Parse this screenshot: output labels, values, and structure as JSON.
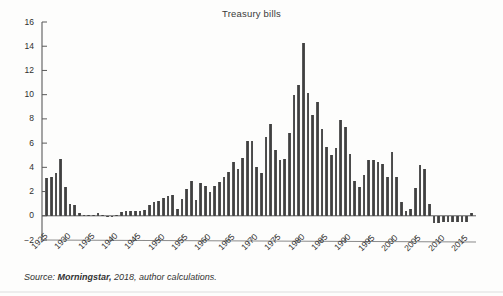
{
  "chart": {
    "title": "Treasury bills",
    "source_prefix": "Source:",
    "source_emphasis": "Morningstar,",
    "source_rest": "2018, author calculations."
  },
  "chart_data": {
    "type": "bar",
    "title": "Treasury bills",
    "xlabel": "",
    "ylabel": "",
    "ylim": [
      -2,
      16
    ],
    "ytick_values": [
      -2,
      0,
      2,
      4,
      6,
      8,
      10,
      12,
      14,
      16
    ],
    "ytick_labels": [
      "−2",
      "0",
      "2",
      "4",
      "6",
      "8",
      "10",
      "12",
      "14",
      "16"
    ],
    "xtick_labels": [
      "1925",
      "1930",
      "1935",
      "1940",
      "1945",
      "1950",
      "1955",
      "1960",
      "1965",
      "1970",
      "1975",
      "1980",
      "1985",
      "1990",
      "1995",
      "2000",
      "2005",
      "2010",
      "2015"
    ],
    "xtick_values": [
      1925,
      1930,
      1935,
      1940,
      1945,
      1950,
      1955,
      1960,
      1965,
      1970,
      1975,
      1980,
      1985,
      1990,
      1995,
      2000,
      2005,
      2010,
      2015
    ],
    "xlim": [
      1925,
      2018
    ],
    "grid": false,
    "legend": false,
    "bar_color": "#4a4a4a",
    "categories": [
      1926,
      1927,
      1928,
      1929,
      1930,
      1931,
      1932,
      1933,
      1934,
      1935,
      1936,
      1937,
      1938,
      1939,
      1940,
      1941,
      1942,
      1943,
      1944,
      1945,
      1946,
      1947,
      1948,
      1949,
      1950,
      1951,
      1952,
      1953,
      1954,
      1955,
      1956,
      1957,
      1958,
      1959,
      1960,
      1961,
      1962,
      1963,
      1964,
      1965,
      1966,
      1967,
      1968,
      1969,
      1970,
      1971,
      1972,
      1973,
      1974,
      1975,
      1976,
      1977,
      1978,
      1979,
      1980,
      1981,
      1982,
      1983,
      1984,
      1985,
      1986,
      1987,
      1988,
      1989,
      1990,
      1991,
      1992,
      1993,
      1994,
      1995,
      1996,
      1997,
      1998,
      1999,
      2000,
      2001,
      2002,
      2003,
      2004,
      2005,
      2006,
      2007,
      2008,
      2009,
      2010,
      2011,
      2012,
      2013,
      2014,
      2015,
      2016,
      2017
    ],
    "values": [
      3.1,
      3.2,
      3.5,
      4.7,
      2.4,
      1.0,
      0.9,
      0.2,
      0.1,
      0.1,
      0.1,
      0.2,
      0.1,
      0.0,
      0.0,
      0.1,
      0.3,
      0.4,
      0.4,
      0.4,
      0.4,
      0.5,
      0.9,
      1.1,
      1.2,
      1.5,
      1.6,
      1.7,
      0.6,
      1.4,
      2.2,
      2.9,
      1.3,
      2.7,
      2.5,
      2.0,
      2.5,
      2.8,
      3.2,
      3.6,
      4.4,
      3.9,
      4.8,
      6.2,
      6.2,
      4.0,
      3.5,
      6.5,
      7.6,
      5.4,
      4.6,
      4.7,
      6.8,
      10.0,
      10.8,
      14.3,
      10.1,
      8.3,
      9.4,
      7.2,
      5.7,
      5.0,
      5.6,
      7.9,
      7.3,
      5.1,
      2.9,
      2.4,
      3.4,
      4.6,
      4.6,
      4.4,
      4.3,
      3.2,
      5.3,
      3.2,
      1.1,
      0.4,
      0.6,
      2.3,
      4.2,
      3.9,
      1.0,
      -0.6,
      -0.6,
      -0.5,
      -0.5,
      -0.5,
      -0.5,
      -0.5,
      -0.5,
      0.2
    ]
  }
}
